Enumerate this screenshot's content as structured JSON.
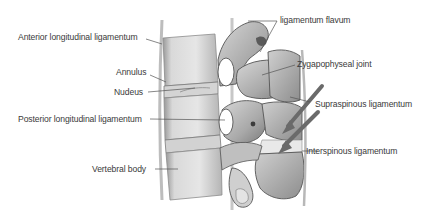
{
  "diagram": {
    "labels": {
      "anterior_longitudinal": "Anterior longitudinal ligamentum",
      "annulus": "Annulus",
      "nucleus": "Nudeus",
      "posterior_longitudinal": "Posterior longitudinal ligamentum",
      "vertebral_body": "Vertebral body",
      "ligamentum_flavum": "ligamentum flavum",
      "zygapophyseal": "Zygapophyseal joint",
      "supraspinous": "Supraspinous ligamentum",
      "interspinous": "Interspinous ligamentum"
    },
    "colors": {
      "bone_light": "#e2e2e2",
      "bone_mid": "#bdbdbd",
      "bone_dark": "#6e6e6e",
      "leader": "#555555",
      "arrow": "#6a6a6a",
      "text": "#3a3a3a"
    }
  }
}
